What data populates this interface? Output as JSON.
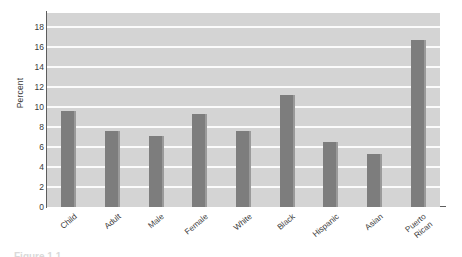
{
  "chart_data": {
    "type": "bar",
    "title": "",
    "subtitle": "",
    "xlabel": "",
    "ylabel": "Percent",
    "ylim": [
      0,
      19.4
    ],
    "grid": true,
    "legend": false,
    "legend_position": "none",
    "categories": [
      "Child",
      "Adult",
      "Male",
      "Female",
      "White",
      "Black",
      "Hispanic",
      "Asian",
      "Puerto\nRican"
    ],
    "values": [
      9.6,
      7.6,
      7.1,
      9.3,
      7.6,
      11.2,
      6.5,
      5.3,
      16.7
    ],
    "ytick_labels": [
      "0",
      "2",
      "4",
      "6",
      "8",
      "10",
      "12",
      "14",
      "16",
      "18"
    ],
    "ytick_values": [
      0,
      2,
      4,
      6,
      8,
      10,
      12,
      14,
      16,
      18
    ],
    "series": [
      {
        "name": "Percent",
        "values": [
          9.6,
          7.6,
          7.1,
          9.3,
          7.6,
          11.2,
          6.5,
          5.3,
          16.7
        ]
      }
    ],
    "annotations": []
  },
  "style": {
    "plot_background": "#d4d4d4",
    "gridline_color": "#fbfbfb",
    "bar_color": "#7d7d7d",
    "bar_highlight_color": "#9a9a9a",
    "axis_color": "#5d5d5d",
    "text_color": "#3a3a3a",
    "page_background": "#ffffff"
  },
  "caption": {
    "partial_text": "Figure 1.1"
  }
}
